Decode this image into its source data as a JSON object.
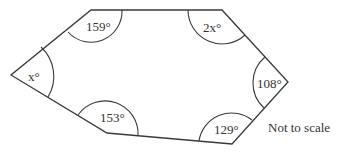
{
  "diagram": {
    "type": "hexagon",
    "vertices": [
      {
        "id": "top-left",
        "x": 91,
        "y": 10,
        "angle_label": "159°"
      },
      {
        "id": "top-right",
        "x": 222,
        "y": 10,
        "angle_label": "2x°"
      },
      {
        "id": "right",
        "x": 288,
        "y": 82,
        "angle_label": "108°"
      },
      {
        "id": "bottom-right",
        "x": 232,
        "y": 144,
        "angle_label": "129°"
      },
      {
        "id": "bottom-left",
        "x": 107,
        "y": 133,
        "angle_label": "153°"
      },
      {
        "id": "left",
        "x": 11,
        "y": 75,
        "angle_label": "x°"
      }
    ],
    "labels": {
      "a159": "159°",
      "a2x": "2x°",
      "a108": "108°",
      "a129": "129°",
      "a153": "153°",
      "ax": "x°"
    },
    "note": "Not to scale"
  }
}
